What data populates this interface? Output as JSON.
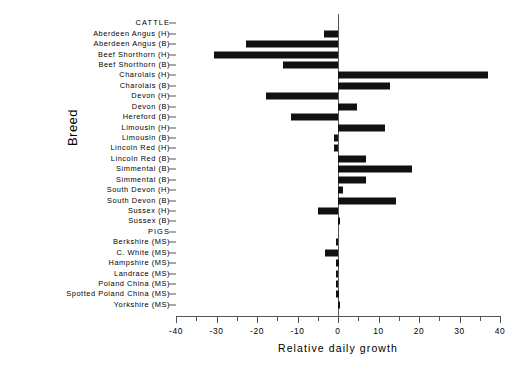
{
  "chart_data": {
    "type": "bar",
    "orientation": "horizontal",
    "title": "",
    "xlabel": "Relative daily growth",
    "ylabel": "Breed",
    "xlim": [
      -40,
      40
    ],
    "xticks": [
      -40,
      -30,
      -20,
      -10,
      0,
      10,
      20,
      30,
      40
    ],
    "xticklabels": [
      "-40",
      "-30",
      "-20",
      "-10",
      "0",
      "10",
      "20",
      "30",
      "40"
    ],
    "minor_tick_step": 5,
    "grid": false,
    "legend": null,
    "zero_reference_line": true,
    "bar_color": "#111111",
    "axis_color": "#555555",
    "categories": [
      "CATTLE",
      "Aberdeen Angus (H)",
      "Aberdeen Angus (B)",
      "Beef Shorthorn (H)",
      "Beef Shorthorn (B)",
      "Charolais (H)",
      "Charolais (B)",
      "Devon (H)",
      "Devon (B)",
      "Hereford (B)",
      "Limousin (H)",
      "Limousin (B)",
      "Lincoln Red (H)",
      "Lincoln Red (B)",
      "Simmental (B)",
      "Simmental (B)",
      "South Devon (H)",
      "South Devon (B)",
      "Sussex (H)",
      "Sussex (B)",
      "PIGS",
      "Berkshire (MS)",
      "C. White (MS)",
      "Hampshire (MS)",
      "Landrace (MS)",
      "Poland China (MS)",
      "Spotted Poland China (MS)",
      "Yorkshire (MS)"
    ],
    "group_headers": [
      "CATTLE",
      "PIGS"
    ],
    "values": [
      null,
      -3.4,
      -22.7,
      -30.6,
      -13.6,
      37.0,
      12.8,
      -17.7,
      4.6,
      -11.6,
      11.6,
      -1.1,
      -1.1,
      7.0,
      18.2,
      6.9,
      1.2,
      14.2,
      -5.0,
      0.5,
      null,
      -0.6,
      -3.1,
      -0.4,
      -0.5,
      -0.5,
      -0.4,
      0.4
    ]
  }
}
